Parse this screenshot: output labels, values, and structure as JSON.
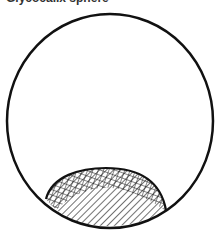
{
  "figure": {
    "title": "Glycocalix sphere",
    "outline_color": "#111111",
    "background": "#ffffff",
    "regions": [
      {
        "name": "cross-hatched-region",
        "fill": "cross-hatch"
      },
      {
        "name": "hatched-region",
        "fill": "diagonal-hatch"
      }
    ]
  }
}
